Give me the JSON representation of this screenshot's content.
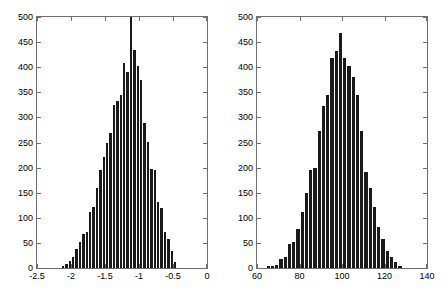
{
  "figure": {
    "background_color": "#ffffff",
    "bar_color": "#1a1a1a",
    "axis_color": "#6f6f6f",
    "caption": ""
  },
  "chart_data": [
    {
      "type": "bar",
      "subplot": "left",
      "title": "",
      "xlabel": "",
      "ylabel": "",
      "grid": false,
      "legend": null,
      "xlim": [
        -2.5,
        0
      ],
      "ylim": [
        0,
        500
      ],
      "xticks": [
        -2.5,
        -2,
        -1.5,
        -1,
        -0.5,
        0
      ],
      "xticklabels": [
        "-2.5",
        "-2",
        "-1.5",
        "-1",
        "-0.5",
        "0"
      ],
      "yticks": [
        0,
        50,
        100,
        150,
        200,
        250,
        300,
        350,
        400,
        450,
        500
      ],
      "yticklabels": [
        "0",
        "50",
        "100",
        "150",
        "200",
        "250",
        "300",
        "350",
        "400",
        "450",
        "500"
      ],
      "bin_width": 0.05,
      "note": "histogram clipped at y=500; central spike exceeds axis top",
      "bin_centers": [
        -2.125,
        -2.075,
        -2.025,
        -1.975,
        -1.925,
        -1.875,
        -1.825,
        -1.775,
        -1.725,
        -1.675,
        -1.625,
        -1.575,
        -1.525,
        -1.475,
        -1.425,
        -1.375,
        -1.325,
        -1.275,
        -1.225,
        -1.175,
        -1.125,
        -1.075,
        -1.025,
        -0.975,
        -0.925,
        -0.875,
        -0.825,
        -0.775,
        -0.725,
        -0.675,
        -0.625,
        -0.575,
        -0.525,
        -0.475
      ],
      "values": [
        4,
        8,
        14,
        22,
        38,
        52,
        68,
        72,
        112,
        122,
        160,
        195,
        222,
        250,
        268,
        325,
        333,
        345,
        408,
        390,
        500,
        435,
        402,
        375,
        288,
        252,
        197,
        196,
        132,
        120,
        72,
        58,
        34,
        12
      ]
    },
    {
      "type": "bar",
      "subplot": "right",
      "title": "",
      "xlabel": "",
      "ylabel": "",
      "grid": false,
      "legend": null,
      "xlim": [
        60,
        140
      ],
      "ylim": [
        0,
        500
      ],
      "xticks": [
        60,
        80,
        100,
        120,
        140
      ],
      "xticklabels": [
        "60",
        "80",
        "100",
        "120",
        "140"
      ],
      "yticks": [
        0,
        50,
        100,
        150,
        200,
        250,
        300,
        350,
        400,
        450,
        500
      ],
      "yticklabels": [
        "0",
        "50",
        "100",
        "150",
        "200",
        "250",
        "300",
        "350",
        "400",
        "450",
        "500"
      ],
      "bin_width": 2,
      "bin_centers": [
        65,
        67,
        69,
        71,
        73,
        75,
        77,
        79,
        81,
        83,
        85,
        87,
        89,
        91,
        93,
        95,
        97,
        99,
        101,
        103,
        105,
        107,
        109,
        111,
        113,
        115,
        117,
        119,
        121,
        123,
        125,
        127
      ],
      "values": [
        4,
        5,
        6,
        18,
        22,
        48,
        52,
        78,
        112,
        150,
        196,
        200,
        272,
        323,
        345,
        418,
        432,
        468,
        418,
        403,
        380,
        345,
        272,
        192,
        160,
        122,
        82,
        58,
        34,
        22,
        12,
        5
      ]
    }
  ]
}
